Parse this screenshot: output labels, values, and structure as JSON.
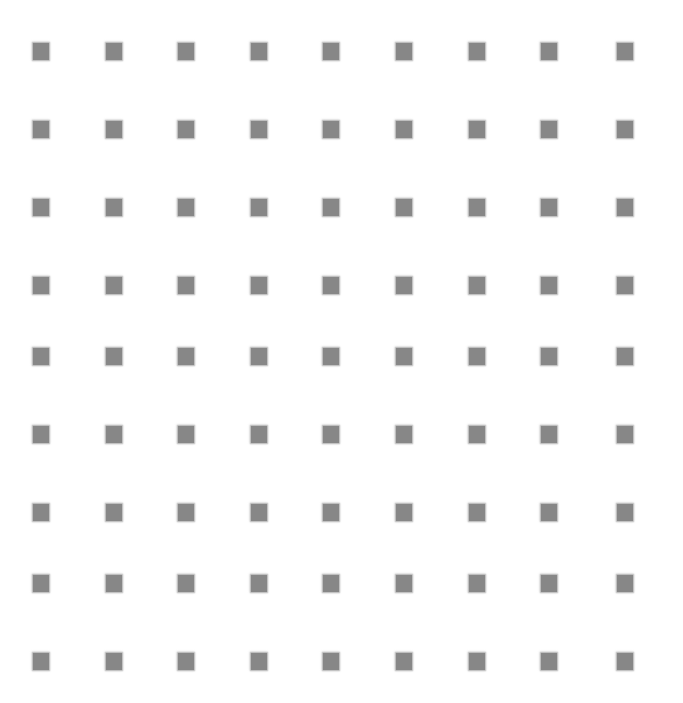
{
  "canvas": {
    "width": 683,
    "height": 703,
    "background_color": "#ffffff"
  },
  "pattern": {
    "name": "square-dot-grid",
    "marker_shape": "square",
    "marker_color": "#878787",
    "marker_width": 16,
    "marker_height": 17,
    "edge_softness": "blurred",
    "rows": 9,
    "columns": 9,
    "total_markers": 81,
    "column_spacing": 72,
    "row_spacing": 78,
    "first_column_x": 33,
    "first_row_y": 43,
    "column_x_positions": [
      33,
      106,
      178,
      251,
      323,
      396,
      469,
      541,
      617
    ],
    "row_y_positions": [
      43,
      121,
      199,
      277,
      348,
      426,
      504,
      575,
      653
    ]
  }
}
